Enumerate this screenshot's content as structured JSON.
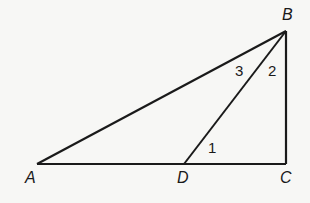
{
  "diagram": {
    "type": "geometry-triangle",
    "points": {
      "A": {
        "label": "A",
        "x": 37,
        "y": 164
      },
      "D": {
        "label": "D",
        "x": 184,
        "y": 164
      },
      "C": {
        "label": "C",
        "x": 286,
        "y": 164
      },
      "B": {
        "label": "B",
        "x": 286,
        "y": 31
      }
    },
    "segments": [
      "AB",
      "BC",
      "AC",
      "BD"
    ],
    "angle_labels": {
      "angle1": "1",
      "angle2": "2",
      "angle3": "3"
    },
    "stroke_color": "#1a1a1a",
    "background": "#f7f7f5"
  }
}
